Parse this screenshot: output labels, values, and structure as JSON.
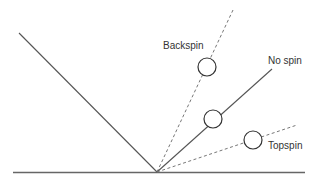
{
  "diagram": {
    "type": "ball-bounce-spin",
    "labels": {
      "backspin": "Backspin",
      "no_spin": "No spin",
      "topspin": "Topspin"
    },
    "colors": {
      "line": "#555555",
      "dashed": "#777777",
      "background": "#ffffff"
    }
  }
}
